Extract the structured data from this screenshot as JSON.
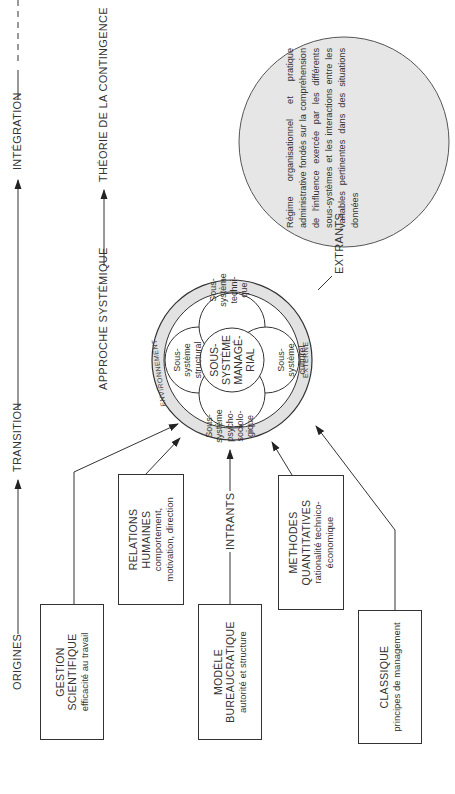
{
  "timeline": {
    "stages": [
      {
        "label": "ORIGINES"
      },
      {
        "label": "TRANSITION"
      },
      {
        "label": "INTÉGRATION"
      }
    ]
  },
  "approaches": {
    "systemic": "APPROCHE SYSTÉMIQUE",
    "contingency": "THÉORIE DE LA CONTINGENCE"
  },
  "flows": {
    "inputs": "INTRANTS",
    "outputs": "EXTRANTS"
  },
  "schools": [
    {
      "title_lines": [
        "GESTION",
        "SCIENTIFIQUE"
      ],
      "subtitle_lines": [
        "efficacité au travail"
      ]
    },
    {
      "title_lines": [
        "RELATIONS",
        "HUMAINES"
      ],
      "subtitle_lines": [
        "comportement,",
        "motivation, direction"
      ]
    },
    {
      "title_lines": [
        "MODÈLE",
        "BUREAUCRATIQUE"
      ],
      "subtitle_lines": [
        "autorité et structure"
      ]
    },
    {
      "title_lines": [
        "METHODES",
        "QUANTITATIVES"
      ],
      "subtitle_lines": [
        "rationalité technico-",
        "économique"
      ]
    },
    {
      "title_lines": [
        "CLASSIQUE"
      ],
      "subtitle_lines": [
        "principes de management"
      ]
    }
  ],
  "system": {
    "environment_label_left": "ENVIRONNEMENT",
    "environment_label_right": "EXTERNE",
    "center_lines": [
      "SOUS-",
      "SYSTÈME",
      "MANAGÉ-",
      "RIAL"
    ],
    "subsystems": [
      {
        "lines": [
          "Sous-",
          "système",
          "structural"
        ]
      },
      {
        "lines": [
          "Sous-",
          "système",
          "techni-",
          "que"
        ]
      },
      {
        "lines": [
          "Sous-",
          "système",
          "culturel"
        ]
      },
      {
        "lines": [
          "Sous-",
          "système",
          "psycho-",
          "sociolo-",
          "gique"
        ]
      }
    ]
  },
  "contingency_description": "Régime organisationnel et pratique administrative fondés sur la compréhension de l'influence exercée par les différents sous-systèmes et les interactions entre les variables pertinentes dans des situations données",
  "colors": {
    "line": "#333333",
    "ring_fill": "#e2e2e2",
    "contingency_fill": "#e6e6e6",
    "background": "#ffffff"
  }
}
